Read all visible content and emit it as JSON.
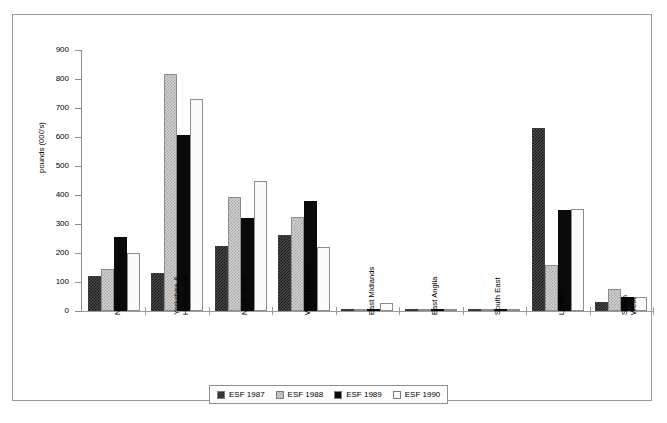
{
  "chart_data": {
    "type": "bar",
    "title": "",
    "subtitle": "",
    "xlabel": "",
    "ylabel": "pounds (000's)",
    "ylim": [
      0,
      900
    ],
    "yticks": [
      0,
      100,
      200,
      300,
      400,
      500,
      600,
      700,
      800,
      900
    ],
    "ytick_labels": [
      "0",
      "100",
      "200",
      "300",
      "400",
      "500",
      "600",
      "700",
      "800",
      "900"
    ],
    "grid": false,
    "legend_position": "bottom-center",
    "categories": [
      "North",
      "Yorkshire &\nHumberside",
      "North West",
      "West Midlands",
      "East Midlands",
      "East Anglia",
      "South East",
      "London",
      "South West"
    ],
    "series": [
      {
        "name": "ESF 1987",
        "pattern": "dark-checker",
        "color": "#3b3b3b",
        "values": [
          122,
          130,
          225,
          263,
          7,
          2,
          3,
          632,
          32
        ]
      },
      {
        "name": "ESF 1988",
        "pattern": "light-checker",
        "color": "#d2d2d2",
        "values": [
          145,
          818,
          392,
          325,
          6,
          4,
          4,
          158,
          75
        ]
      },
      {
        "name": "ESF 1989",
        "pattern": "solid-black",
        "color": "#0a0a0a",
        "values": [
          255,
          608,
          320,
          378,
          8,
          6,
          4,
          350,
          48
        ]
      },
      {
        "name": "ESF 1990",
        "pattern": "white",
        "color": "#fbfbfb",
        "values": [
          200,
          730,
          447,
          220,
          28,
          7,
          5,
          352,
          48
        ]
      }
    ]
  },
  "legend": {
    "items": [
      {
        "label": "ESF 1987"
      },
      {
        "label": "ESF 1988"
      },
      {
        "label": "ESF 1989"
      },
      {
        "label": "ESF 1990"
      }
    ]
  }
}
